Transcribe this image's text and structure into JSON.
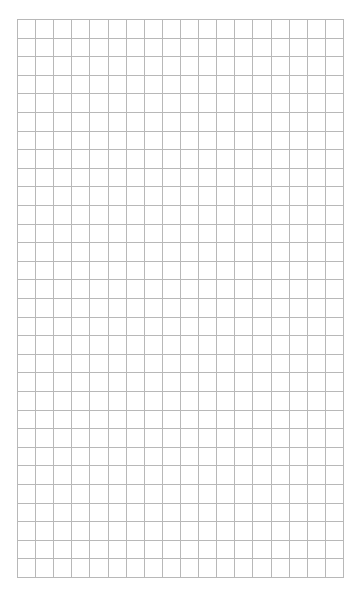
{
  "grid": {
    "columns": 18,
    "rows": 30,
    "line_color": "#b8b8b8",
    "background": "#ffffff"
  }
}
